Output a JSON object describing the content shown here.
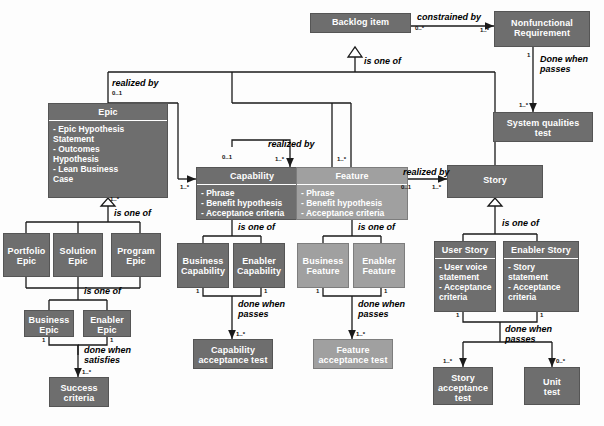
{
  "diagram": {
    "colors": {
      "dark_node": "#6e6e6e",
      "light_node": "#a0a0a0",
      "line": "#1a1a1a",
      "text_on_node": "#ffffff"
    },
    "nodes": {
      "backlog_item": {
        "title": "Backlog item",
        "attrs": []
      },
      "nonfunctional_req": {
        "title": "Nonfunctional\nRequirement",
        "attrs": []
      },
      "system_qualities": {
        "title": "System qualities\ntest",
        "attrs": []
      },
      "epic": {
        "title": "Epic",
        "attrs": [
          "- Epic Hypothesis",
          "  Statement",
          "- Outcomes",
          "  Hypothesis",
          "- Lean Business",
          "  Case"
        ]
      },
      "capability": {
        "title": "Capability",
        "attrs": [
          "- Phrase",
          "- Benefit hypothesis",
          "- Acceptance criteria"
        ]
      },
      "feature": {
        "title": "Feature",
        "attrs": [
          "- Phrase",
          "- Benefit hypothesis",
          "- Acceptance criteria"
        ]
      },
      "story": {
        "title": "Story",
        "attrs": []
      },
      "portfolio_epic": {
        "title": "Portfolio\nEpic",
        "attrs": []
      },
      "solution_epic": {
        "title": "Solution\nEpic",
        "attrs": []
      },
      "program_epic": {
        "title": "Program\nEpic",
        "attrs": []
      },
      "business_epic": {
        "title": "Business\nEpic",
        "attrs": []
      },
      "enabler_epic": {
        "title": "Enabler\nEpic",
        "attrs": []
      },
      "success_criteria": {
        "title": "Success\ncriteria",
        "attrs": []
      },
      "business_capability": {
        "title": "Business\nCapability",
        "attrs": []
      },
      "enabler_capability": {
        "title": "Enabler\nCapability",
        "attrs": []
      },
      "capability_test": {
        "title": "Capability\nacceptance test",
        "attrs": []
      },
      "business_feature": {
        "title": "Business\nFeature",
        "attrs": []
      },
      "enabler_feature": {
        "title": "Enabler\nFeature",
        "attrs": []
      },
      "feature_test": {
        "title": "Feature\nacceptance test",
        "attrs": []
      },
      "user_story": {
        "title": "User Story",
        "attrs": [
          "- User voice",
          "  statement",
          "- Acceptance",
          "  criteria"
        ]
      },
      "enabler_story": {
        "title": "Enabler Story",
        "attrs": [
          "- Story statement",
          "- Acceptance",
          "  criteria"
        ]
      },
      "story_test": {
        "title": "Story\nacceptance\ntest",
        "attrs": []
      },
      "unit_test": {
        "title": "Unit\ntest",
        "attrs": []
      }
    },
    "relations": {
      "constrained_by": "constrained by",
      "is_one_of_backlog": "is one of",
      "done_when_passes_nfr": "Done when\npasses",
      "realized_by_epic": "realized by",
      "realized_by_capability": "realized by",
      "realized_by_feature": "realized by",
      "is_one_of_epic": "is one of",
      "is_one_of_epic2": "is one of",
      "done_when_satisfies": "done when\nsatisfies",
      "is_one_of_capability": "is one of",
      "done_when_passes_capability": "done when\npasses",
      "is_one_of_feature": "is one of",
      "done_when_passes_feature": "done when\npasses",
      "is_one_of_story": "is one of",
      "done_when_passes_story": "done when\npasses"
    },
    "multiplicities": {
      "backlog_constrained_src": "0..*",
      "nfr_target": "1..*",
      "nfr_src": "1",
      "sys_qual_target": "1..*",
      "epic_realized_src": "0..1",
      "capability_target": "1..*",
      "capability_realized_src": "0..1",
      "feature_target_left": "1..*",
      "feature_target_right": "1..*",
      "feature_realized_src": "0..1",
      "story_target": "1..*",
      "epic_gen": "1..*",
      "business_epic_src": "1",
      "enabler_epic_src": "1",
      "success_criteria_target": "1..*",
      "business_capability_src": "1",
      "enabler_capability_src": "1",
      "capability_test_target": "1..*",
      "business_feature_src": "1",
      "enabler_feature_src": "1",
      "feature_test_target": "1..*",
      "user_story_src": "1",
      "enabler_story_src": "1",
      "story_test_target": "1..*",
      "unit_test_target": "0..*"
    }
  }
}
